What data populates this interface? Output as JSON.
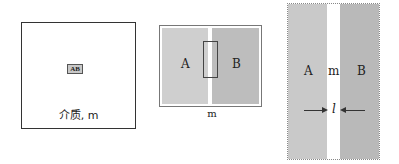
{
  "panel1": {
    "inner_label": "AB",
    "caption": "介质, m"
  },
  "panel2": {
    "region_a_label": "A",
    "region_b_label": "B",
    "caption": "m",
    "colors": {
      "region_a": "#cfcfcf",
      "region_b": "#bdbdbd",
      "gap": "#ffffff"
    }
  },
  "panel3": {
    "region_a_label": "A",
    "gap_label": "m",
    "region_b_label": "B",
    "distance_label": "l",
    "colors": {
      "region_a": "#c9c9c9",
      "region_b": "#b9b9b9",
      "gap": "#ffffff"
    }
  }
}
